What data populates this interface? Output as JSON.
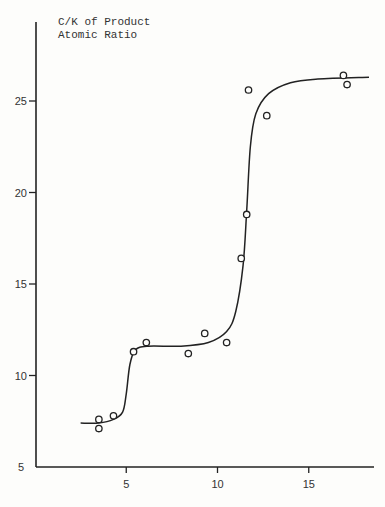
{
  "chart_data": {
    "type": "scatter",
    "title": "",
    "ylabel_lines": [
      "C/K of Product",
      "Atomic Ratio"
    ],
    "xlabel": "",
    "xlim": [
      0,
      19
    ],
    "ylim": [
      5,
      28
    ],
    "x_ticks": [
      5,
      10,
      15
    ],
    "x_tick_labels": [
      "5",
      "10",
      "15"
    ],
    "y_ticks": [
      5,
      10,
      15,
      20,
      25
    ],
    "y_tick_labels": [
      "5",
      "10",
      "15",
      "20",
      "25"
    ],
    "grid": false,
    "legend": null,
    "series": [
      {
        "name": "measured",
        "marker": "open-circle",
        "points": [
          {
            "x": 3.5,
            "y": 7.6
          },
          {
            "x": 3.5,
            "y": 7.1
          },
          {
            "x": 4.3,
            "y": 7.8
          },
          {
            "x": 5.4,
            "y": 11.3
          },
          {
            "x": 6.1,
            "y": 11.8
          },
          {
            "x": 8.4,
            "y": 11.2
          },
          {
            "x": 9.3,
            "y": 12.3
          },
          {
            "x": 10.5,
            "y": 11.8
          },
          {
            "x": 11.3,
            "y": 16.4
          },
          {
            "x": 11.6,
            "y": 18.8
          },
          {
            "x": 11.7,
            "y": 25.6
          },
          {
            "x": 12.7,
            "y": 24.2
          },
          {
            "x": 16.9,
            "y": 26.4
          },
          {
            "x": 17.1,
            "y": 25.9
          }
        ]
      },
      {
        "name": "fitted curve",
        "marker": "line",
        "points": [
          {
            "x": 2.5,
            "y": 7.4
          },
          {
            "x": 3.5,
            "y": 7.4
          },
          {
            "x": 4.3,
            "y": 7.6
          },
          {
            "x": 4.8,
            "y": 8.0
          },
          {
            "x": 5.0,
            "y": 9.0
          },
          {
            "x": 5.2,
            "y": 10.6
          },
          {
            "x": 5.5,
            "y": 11.4
          },
          {
            "x": 6.2,
            "y": 11.6
          },
          {
            "x": 8.0,
            "y": 11.6
          },
          {
            "x": 9.5,
            "y": 11.8
          },
          {
            "x": 10.5,
            "y": 12.4
          },
          {
            "x": 11.0,
            "y": 13.5
          },
          {
            "x": 11.4,
            "y": 16.0
          },
          {
            "x": 11.6,
            "y": 19.0
          },
          {
            "x": 11.8,
            "y": 22.5
          },
          {
            "x": 12.1,
            "y": 24.3
          },
          {
            "x": 12.8,
            "y": 25.4
          },
          {
            "x": 14.0,
            "y": 26.0
          },
          {
            "x": 15.5,
            "y": 26.2
          },
          {
            "x": 18.3,
            "y": 26.3
          }
        ]
      }
    ]
  },
  "labels": {
    "ylabel_line1": "C/K of Product",
    "ylabel_line2": "Atomic Ratio"
  }
}
